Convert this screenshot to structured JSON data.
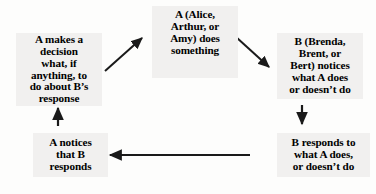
{
  "diagram": {
    "type": "cycle-flowchart",
    "background_color": "#fdfdfc",
    "node_fill_color": "#f1f0ef",
    "text_color": "#000000",
    "arrow_color": "#1a1a1a",
    "nodes": [
      {
        "id": "a-does-something",
        "label": "A (Alice,\nArthur, or\nAmy) does\nsomething"
      },
      {
        "id": "b-notices",
        "label": "B (Brenda,\nBrent, or\nBert) notices\nwhat A does\nor doesn’t do"
      },
      {
        "id": "b-responds",
        "label": "B responds to\nwhat A does,\nor doesn’t do"
      },
      {
        "id": "a-notices",
        "label": "A notices\nthat B\nresponds"
      },
      {
        "id": "a-decides",
        "label": "A makes a\ndecision\nwhat, if\nanything, to\ndo about B’s\nresponse"
      }
    ],
    "edges": [
      {
        "id": "edge-a-to-b",
        "from": "a-does-something",
        "to": "b-notices",
        "direction": "down-right"
      },
      {
        "id": "edge-b-notices-to-b-responds",
        "from": "b-notices",
        "to": "b-responds",
        "direction": "down"
      },
      {
        "id": "edge-b-responds-to-a-notices",
        "from": "b-responds",
        "to": "a-notices",
        "direction": "left"
      },
      {
        "id": "edge-a-notices-to-a-decides",
        "from": "a-notices",
        "to": "a-decides",
        "direction": "up"
      },
      {
        "id": "edge-a-decides-to-a-does",
        "from": "a-decides",
        "to": "a-does-something",
        "direction": "up-right"
      }
    ]
  }
}
